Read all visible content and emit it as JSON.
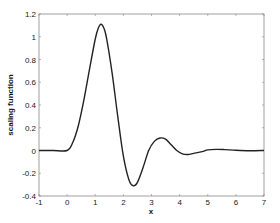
{
  "chart_data": {
    "type": "line",
    "title": "",
    "xlabel": "x",
    "ylabel": "scaling function",
    "xlim": [
      -1,
      7
    ],
    "ylim": [
      -0.4,
      1.2
    ],
    "grid": false,
    "legend": null,
    "xticks": [
      -1,
      0,
      1,
      2,
      3,
      4,
      5,
      6,
      7
    ],
    "xtick_labels": [
      "-1",
      "0",
      "1",
      "2",
      "3",
      "4",
      "5",
      "6",
      "7"
    ],
    "yticks": [
      -0.4,
      -0.2,
      0,
      0.2,
      0.4,
      0.6,
      0.8,
      1,
      1.2
    ],
    "ytick_labels": [
      "-0.4",
      "-0.2",
      "0",
      "0.2",
      "0.4",
      "0.6",
      "0.8",
      "1",
      "1.2"
    ],
    "series": [
      {
        "name": "scaling function",
        "color": "#222222",
        "x": [
          -1,
          -0.5,
          0,
          0.2,
          0.4,
          0.6,
          0.8,
          1.0,
          1.1,
          1.2,
          1.3,
          1.4,
          1.6,
          1.8,
          2.0,
          2.2,
          2.35,
          2.5,
          2.7,
          2.9,
          3.1,
          3.3,
          3.5,
          3.7,
          3.9,
          4.1,
          4.3,
          4.5,
          4.8,
          5.0,
          5.3,
          5.6,
          6.0,
          6.5,
          7.0
        ],
        "y": [
          0,
          0,
          0,
          0.07,
          0.22,
          0.45,
          0.72,
          0.98,
          1.07,
          1.11,
          1.08,
          0.99,
          0.68,
          0.3,
          -0.05,
          -0.26,
          -0.31,
          -0.28,
          -0.15,
          0.0,
          0.08,
          0.11,
          0.1,
          0.05,
          0.0,
          -0.03,
          -0.035,
          -0.025,
          -0.01,
          0.005,
          0.01,
          0.008,
          0.002,
          -0.002,
          0
        ]
      }
    ]
  }
}
